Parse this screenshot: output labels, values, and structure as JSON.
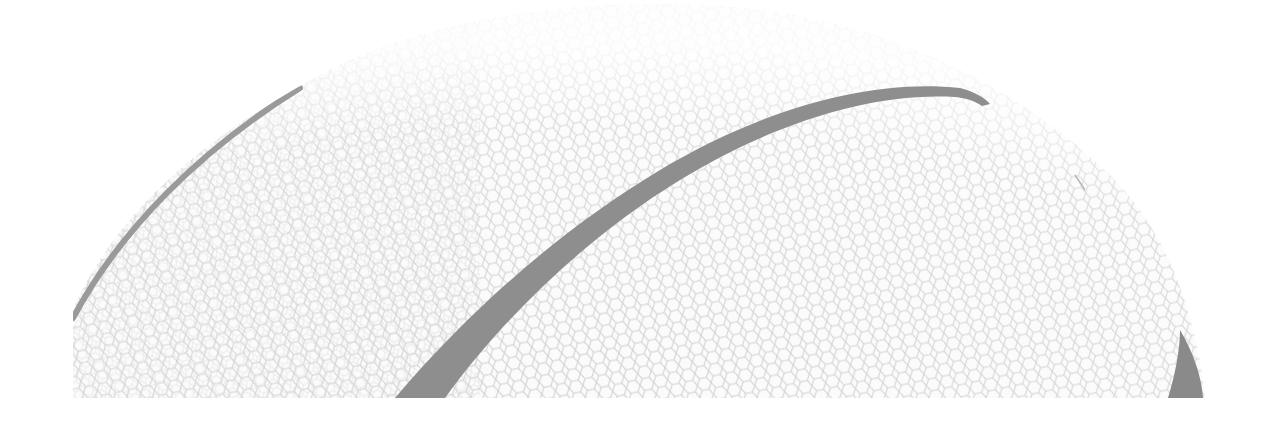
{
  "image": {
    "subject": "basketball close-up, grayscale",
    "width": 1272,
    "height": 435,
    "colors": {
      "background": "#ffffff",
      "ball_surface": "#fbfbfb",
      "pebble_texture": "#d0d0d0",
      "seam": "#8e8e8e"
    }
  }
}
